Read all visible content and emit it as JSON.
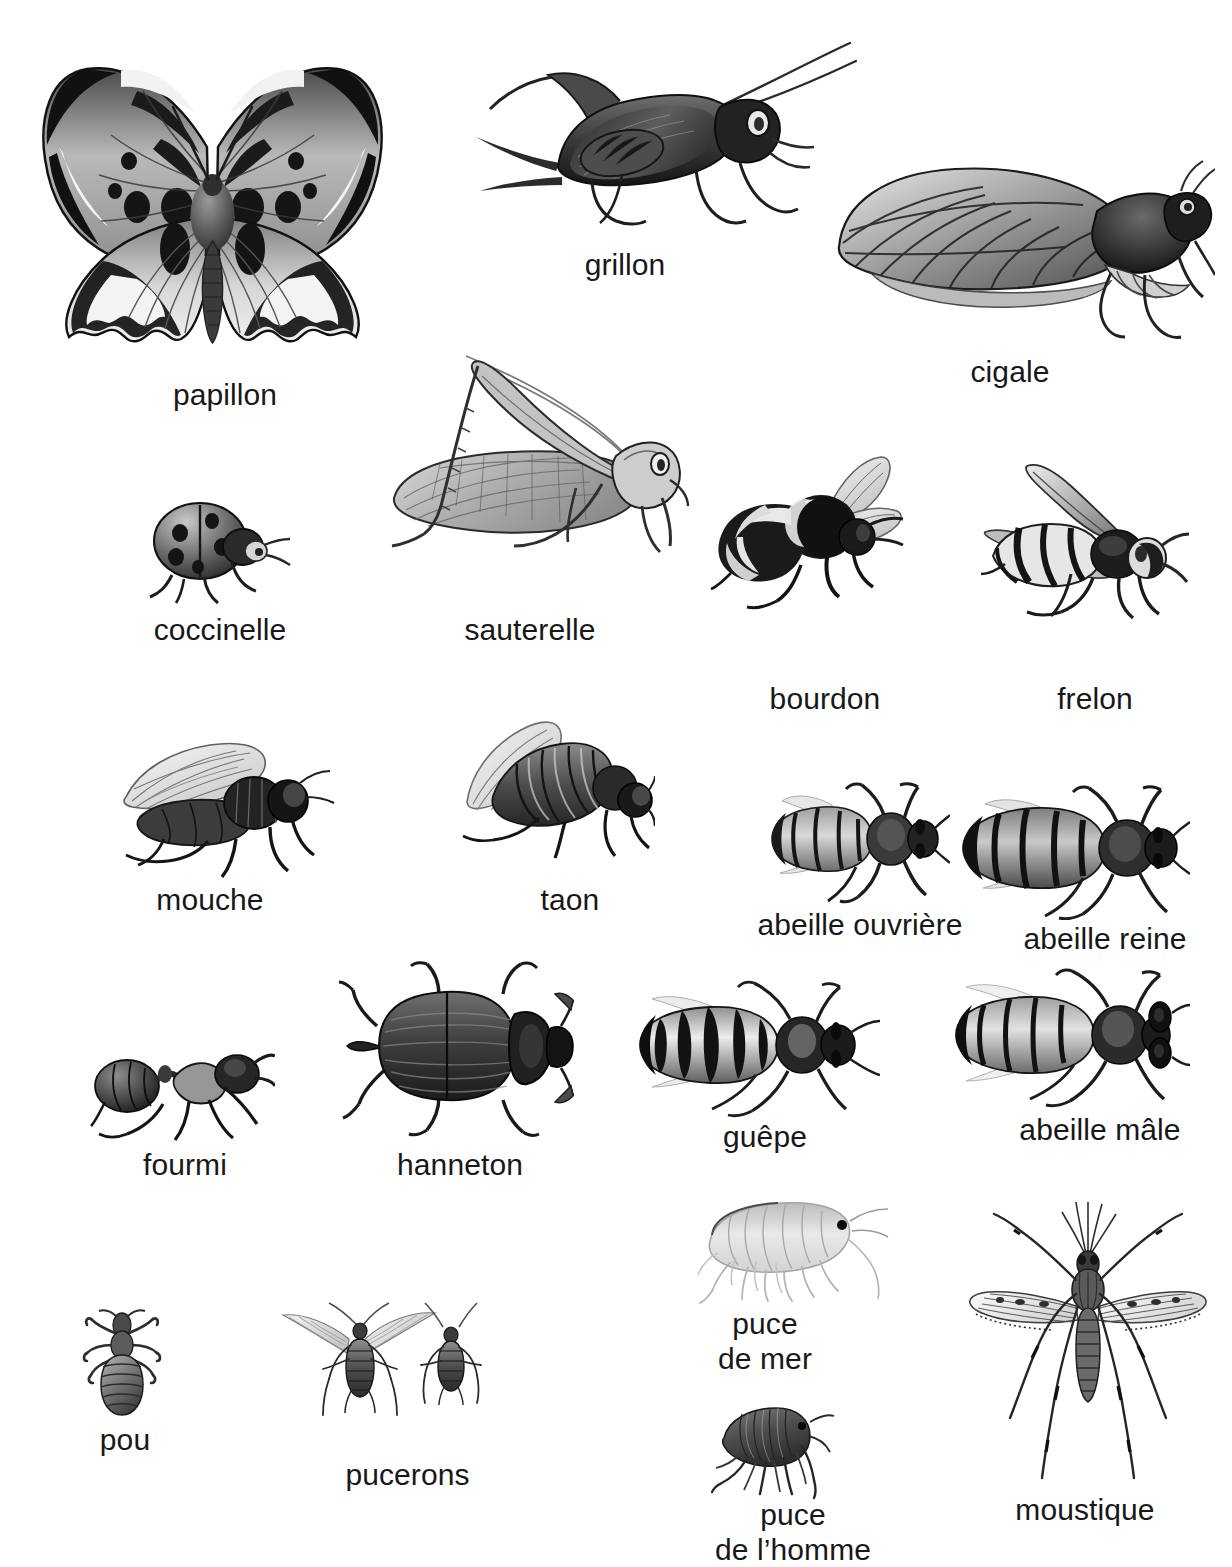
{
  "poster": {
    "title": "Insectes",
    "language": "fr",
    "background_color": "#ffffff",
    "text_color": "#181818",
    "style": "black-and-white engraving illustrations with French captions"
  },
  "entries": [
    {
      "id": "papillon",
      "label": "papillon",
      "icon": "butterfly-illustration"
    },
    {
      "id": "grillon",
      "label": "grillon",
      "icon": "cricket-illustration"
    },
    {
      "id": "cigale",
      "label": "cigale",
      "icon": "cicada-illustration"
    },
    {
      "id": "coccinelle",
      "label": "coccinelle",
      "icon": "ladybug-illustration"
    },
    {
      "id": "sauterelle",
      "label": "sauterelle",
      "icon": "grasshopper-illustration"
    },
    {
      "id": "bourdon",
      "label": "bourdon",
      "icon": "bumblebee-illustration"
    },
    {
      "id": "frelon",
      "label": "frelon",
      "icon": "hornet-illustration"
    },
    {
      "id": "mouche",
      "label": "mouche",
      "icon": "housefly-illustration"
    },
    {
      "id": "taon",
      "label": "taon",
      "icon": "horsefly-illustration"
    },
    {
      "id": "abeille-ouvriere",
      "label": "abeille ouvrière",
      "icon": "worker-bee-illustration"
    },
    {
      "id": "abeille-reine",
      "label": "abeille reine",
      "icon": "queen-bee-illustration"
    },
    {
      "id": "fourmi",
      "label": "fourmi",
      "icon": "ant-illustration"
    },
    {
      "id": "hanneton",
      "label": "hanneton",
      "icon": "cockchafer-illustration"
    },
    {
      "id": "guepe",
      "label": "guêpe",
      "icon": "wasp-illustration"
    },
    {
      "id": "abeille-male",
      "label": "abeille mâle",
      "icon": "drone-bee-illustration"
    },
    {
      "id": "pou",
      "label": "pou",
      "icon": "louse-illustration"
    },
    {
      "id": "pucerons",
      "label": "pucerons",
      "icon": "aphids-illustration"
    },
    {
      "id": "puce-de-mer",
      "label": "puce\nde mer",
      "icon": "sandhopper-illustration"
    },
    {
      "id": "puce-de-l-homme",
      "label": "puce\nde l’homme",
      "icon": "human-flea-illustration"
    },
    {
      "id": "moustique",
      "label": "moustique",
      "icon": "mosquito-illustration"
    }
  ]
}
